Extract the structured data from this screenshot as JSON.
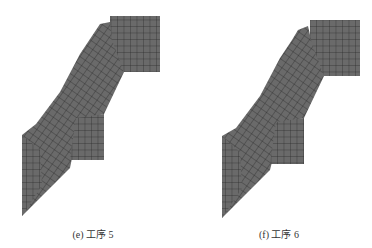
{
  "figures": [
    {
      "id": "e",
      "caption": "(e) 工序 5",
      "mesh_fill": "#6a6a6a",
      "mesh_line": "#2a2a2a"
    },
    {
      "id": "f",
      "caption": "(f) 工序 6",
      "mesh_fill": "#6a6a6a",
      "mesh_line": "#2a2a2a"
    }
  ]
}
